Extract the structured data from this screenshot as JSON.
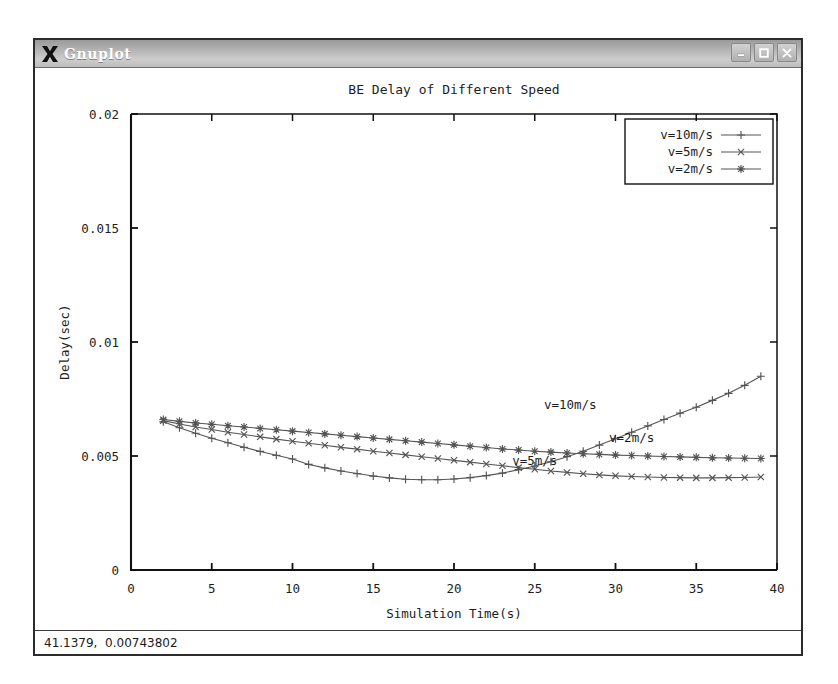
{
  "window": {
    "title": "Gnuplot",
    "logo_icon": "x-logo-icon",
    "buttons": [
      {
        "name": "minimize-button",
        "icon": "minimize-icon",
        "label": "_"
      },
      {
        "name": "maximize-button",
        "icon": "maximize-icon",
        "label": "□"
      },
      {
        "name": "close-button",
        "icon": "close-icon",
        "label": "×"
      }
    ]
  },
  "statusbar": {
    "coordinates": "41.1379,  0.00743802"
  },
  "chart_data": {
    "type": "line",
    "title": "BE Delay of Different Speed",
    "xlabel": "Simulation Time(s)",
    "ylabel": "Delay(sec)",
    "xlim": [
      0,
      40
    ],
    "ylim": [
      0,
      0.02
    ],
    "xticks": [
      0,
      5,
      10,
      15,
      20,
      25,
      30,
      35,
      40
    ],
    "xticklabels": [
      "0",
      "5",
      "10",
      "15",
      "20",
      "25",
      "30",
      "35",
      "40"
    ],
    "yticks": [
      0,
      0.005,
      0.01,
      0.015,
      0.02
    ],
    "yticklabels": [
      "0",
      "0.005",
      "0.01",
      "0.015",
      "0.02"
    ],
    "grid": false,
    "legend_position": "top-right",
    "legend_border": true,
    "series": [
      {
        "name": "v=10m/s",
        "marker": "plus",
        "color": "#555555",
        "x": [
          2.0,
          3.0,
          4.0,
          5.0,
          6.0,
          7.0,
          8.0,
          9.0,
          10.0,
          11.0,
          12.0,
          13.0,
          14.0,
          15.0,
          16.0,
          17.0,
          18.0,
          19.0,
          20.0,
          21.0,
          22.0,
          23.0,
          24.0,
          25.0,
          26.0,
          27.0,
          28.0,
          29.0,
          30.0,
          31.0,
          32.0,
          33.0,
          34.0,
          35.0,
          36.0,
          37.0,
          38.0,
          39.0
        ],
        "y": [
          0.0065,
          0.00624,
          0.006,
          0.00578,
          0.00558,
          0.00538,
          0.0052,
          0.00503,
          0.00487,
          0.00463,
          0.00448,
          0.00434,
          0.00423,
          0.00412,
          0.00404,
          0.00398,
          0.00396,
          0.00396,
          0.00399,
          0.00405,
          0.00414,
          0.00425,
          0.0044,
          0.00456,
          0.00475,
          0.00497,
          0.00521,
          0.00548,
          0.00576,
          0.00604,
          0.00632,
          0.0066,
          0.00688,
          0.00714,
          0.00744,
          0.00775,
          0.0081,
          0.0085
        ]
      },
      {
        "name": "v=5m/s",
        "marker": "cross",
        "color": "#555555",
        "x": [
          2.0,
          3.0,
          4.0,
          5.0,
          6.0,
          7.0,
          8.0,
          9.0,
          10.0,
          11.0,
          12.0,
          13.0,
          14.0,
          15.0,
          16.0,
          17.0,
          18.0,
          19.0,
          20.0,
          21.0,
          22.0,
          23.0,
          24.0,
          25.0,
          26.0,
          27.0,
          28.0,
          29.0,
          30.0,
          31.0,
          32.0,
          33.0,
          34.0,
          35.0,
          36.0,
          37.0,
          38.0,
          39.0
        ],
        "y": [
          0.00655,
          0.0064,
          0.00627,
          0.00616,
          0.00604,
          0.00594,
          0.00584,
          0.00574,
          0.00565,
          0.00556,
          0.00547,
          0.00538,
          0.0053,
          0.00521,
          0.00513,
          0.00505,
          0.00497,
          0.00489,
          0.00481,
          0.00473,
          0.00465,
          0.00457,
          0.00449,
          0.00442,
          0.00434,
          0.00428,
          0.00422,
          0.00417,
          0.00413,
          0.0041,
          0.00408,
          0.00406,
          0.00405,
          0.00404,
          0.00404,
          0.00405,
          0.00406,
          0.00408
        ]
      },
      {
        "name": "v=2m/s",
        "marker": "star",
        "color": "#555555",
        "x": [
          2.0,
          3.0,
          4.0,
          5.0,
          6.0,
          7.0,
          8.0,
          9.0,
          10.0,
          11.0,
          12.0,
          13.0,
          14.0,
          15.0,
          16.0,
          17.0,
          18.0,
          19.0,
          20.0,
          21.0,
          22.0,
          23.0,
          24.0,
          25.0,
          26.0,
          27.0,
          28.0,
          29.0,
          30.0,
          31.0,
          32.0,
          33.0,
          34.0,
          35.0,
          36.0,
          37.0,
          38.0,
          39.0
        ],
        "y": [
          0.0066,
          0.00652,
          0.00645,
          0.00639,
          0.00633,
          0.00627,
          0.00621,
          0.00615,
          0.00609,
          0.00603,
          0.00597,
          0.00591,
          0.00585,
          0.00579,
          0.00573,
          0.00567,
          0.00561,
          0.00555,
          0.00549,
          0.00543,
          0.00537,
          0.00531,
          0.00526,
          0.00521,
          0.00517,
          0.00513,
          0.0051,
          0.00507,
          0.00504,
          0.00502,
          0.005,
          0.00498,
          0.00496,
          0.00494,
          0.00492,
          0.00491,
          0.0049,
          0.00489
        ]
      }
    ],
    "annotations": [
      {
        "text": "v=10m/s",
        "x": 27.2,
        "y": 0.00705
      },
      {
        "text": "v=2m/s",
        "x": 31.0,
        "y": 0.00562
      },
      {
        "text": "v=5m/s",
        "x": 25.0,
        "y": 0.00462
      }
    ]
  }
}
